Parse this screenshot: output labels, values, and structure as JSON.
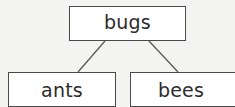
{
  "diagram": {
    "type": "tree",
    "root": {
      "label": "bugs"
    },
    "children": [
      {
        "label": "ants"
      },
      {
        "label": "bees"
      }
    ],
    "edges": [
      {
        "from": "bugs",
        "to": "ants"
      },
      {
        "from": "bugs",
        "to": "bees"
      }
    ],
    "colors": {
      "background": "#f3f3f1",
      "box_fill": "#ffffff",
      "box_border": "#4a4a4a",
      "line": "#555555",
      "text": "#2b2b2b"
    }
  }
}
